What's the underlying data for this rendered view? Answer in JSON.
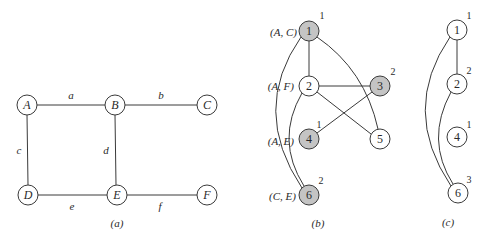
{
  "panel_a": {
    "caption": "(a)",
    "nodes": [
      {
        "id": "A",
        "label": "A",
        "x": 27,
        "y": 105
      },
      {
        "id": "B",
        "label": "B",
        "x": 115,
        "y": 105
      },
      {
        "id": "C",
        "label": "C",
        "x": 207,
        "y": 105
      },
      {
        "id": "D",
        "label": "D",
        "x": 28,
        "y": 195
      },
      {
        "id": "E",
        "label": "E",
        "x": 117,
        "y": 195
      },
      {
        "id": "F",
        "label": "F",
        "x": 207,
        "y": 195
      }
    ],
    "edges": [
      {
        "from": "A",
        "to": "B",
        "label": "a",
        "lx": 71,
        "ly": 95
      },
      {
        "from": "B",
        "to": "C",
        "label": "b",
        "lx": 161,
        "ly": 95
      },
      {
        "from": "A",
        "to": "D",
        "label": "c",
        "lx": 19,
        "ly": 150
      },
      {
        "from": "B",
        "to": "E",
        "label": "d",
        "lx": 106,
        "ly": 150
      },
      {
        "from": "D",
        "to": "E",
        "label": "e",
        "lx": 72,
        "ly": 205
      },
      {
        "from": "E",
        "to": "F",
        "label": "f",
        "lx": 160,
        "ly": 205
      }
    ]
  },
  "panel_b": {
    "caption": "(b)",
    "pair_labels": [
      {
        "text": "(A, C)",
        "x": 297,
        "y": 32
      },
      {
        "text": "(A, F)",
        "x": 294,
        "y": 86
      },
      {
        "text": "(A, E)",
        "x": 294,
        "y": 141
      },
      {
        "text": "(C, E)",
        "x": 296,
        "y": 196
      }
    ],
    "nodes": [
      {
        "id": "1",
        "label": "1",
        "x": 309,
        "y": 31,
        "shaded": true,
        "color": "1"
      },
      {
        "id": "2",
        "label": "2",
        "x": 309,
        "y": 86,
        "shaded": false,
        "color": ""
      },
      {
        "id": "3",
        "label": "3",
        "x": 380,
        "y": 86,
        "shaded": true,
        "color": "2"
      },
      {
        "id": "4",
        "label": "4",
        "x": 309,
        "y": 139,
        "shaded": true,
        "color": "1"
      },
      {
        "id": "5",
        "label": "5",
        "x": 380,
        "y": 139,
        "shaded": false,
        "color": ""
      },
      {
        "id": "6",
        "label": "6",
        "x": 309,
        "y": 195,
        "shaded": true,
        "color": "2"
      }
    ]
  },
  "panel_c": {
    "caption": "(c)",
    "nodes": [
      {
        "id": "1",
        "label": "1",
        "x": 457,
        "y": 30,
        "color": "1"
      },
      {
        "id": "2",
        "label": "2",
        "x": 457,
        "y": 84,
        "color": "2"
      },
      {
        "id": "4",
        "label": "4",
        "x": 457,
        "y": 137,
        "color": "1"
      },
      {
        "id": "6",
        "label": "6",
        "x": 458,
        "y": 193,
        "color": "3"
      }
    ]
  },
  "colors": {
    "stroke": "#3a3a3a",
    "shaded_fill": "#c4c4c4",
    "background": "#ffffff"
  }
}
